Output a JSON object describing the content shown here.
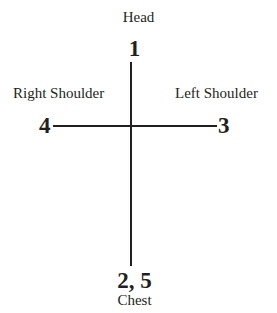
{
  "diagram": {
    "background_color": "#ffffff",
    "line_color": "#231f20",
    "text_color": "#231f20",
    "positions": {
      "head": {
        "label": "Head",
        "number": "1"
      },
      "right_shoulder": {
        "label": "Right Shoulder",
        "number": "4"
      },
      "left_shoulder": {
        "label": "Left Shoulder",
        "number": "3"
      },
      "chest": {
        "label": "Chest",
        "number": "2, 5"
      }
    }
  },
  "chart_data": {
    "type": "scatter",
    "xlabel": "",
    "ylabel": "",
    "xlim": [
      -1,
      1
    ],
    "ylim": [
      -1,
      1
    ],
    "grid": false,
    "legend": "none",
    "axes": [
      {
        "name": "vertical-axis",
        "orientation": "vertical",
        "x": 0,
        "y_start": 1,
        "y_end": -1
      },
      {
        "name": "horizontal-axis",
        "orientation": "horizontal",
        "y": 0,
        "x_start": -1,
        "x_end": 1
      }
    ],
    "points": [
      {
        "label": "Head",
        "number": "1",
        "x": 0,
        "y": 1,
        "position": "top"
      },
      {
        "label": "Left Shoulder",
        "number": "3",
        "x": 1,
        "y": 0,
        "position": "right"
      },
      {
        "label": "Right Shoulder",
        "number": "4",
        "x": -1,
        "y": 0,
        "position": "left"
      },
      {
        "label": "Chest",
        "number": "2, 5",
        "x": 0,
        "y": -1,
        "position": "bottom"
      }
    ],
    "annotations": [
      "Head",
      "1",
      "Right Shoulder",
      "4",
      "Left Shoulder",
      "3",
      "2, 5",
      "Chest"
    ]
  }
}
